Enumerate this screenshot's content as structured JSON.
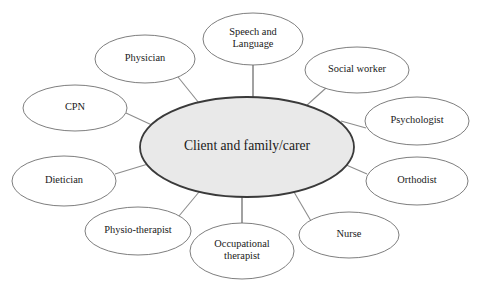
{
  "diagram": {
    "type": "hub-and-spoke",
    "center": {
      "id": "client-and-family-carer",
      "label": "Client and family/carer",
      "lines": [
        "Client and family/carer"
      ],
      "cx": 247,
      "cy": 147,
      "rx": 107,
      "ry": 50,
      "fill_color": "#e9e9e9",
      "stroke_color": "#3a3a3a"
    },
    "satellites": [
      {
        "id": "speech-and-language",
        "label": "Speech and Language",
        "lines": [
          "Speech and",
          "Language"
        ],
        "cx": 253,
        "cy": 39,
        "rx": 50,
        "ry": 26,
        "connector": {
          "x1": 253,
          "y1": 65,
          "x2": 253,
          "y2": 97,
          "weight": "thick"
        }
      },
      {
        "id": "physician",
        "label": "Physician",
        "lines": [
          "Physician"
        ],
        "cx": 145,
        "cy": 59,
        "rx": 50,
        "ry": 24,
        "connector": {
          "x1": 178,
          "y1": 77,
          "x2": 199,
          "y2": 103,
          "weight": "thin"
        }
      },
      {
        "id": "cpn",
        "label": "CPN",
        "lines": [
          "CPN"
        ],
        "cx": 75,
        "cy": 108,
        "rx": 52,
        "ry": 23,
        "connector": {
          "x1": 126,
          "y1": 113,
          "x2": 154,
          "y2": 126,
          "weight": "thin"
        }
      },
      {
        "id": "dietician",
        "label": "Dietician",
        "lines": [
          "Dietician"
        ],
        "cx": 64,
        "cy": 181,
        "rx": 52,
        "ry": 25,
        "connector": {
          "x1": 115,
          "y1": 174,
          "x2": 148,
          "y2": 164,
          "weight": "thin"
        }
      },
      {
        "id": "physio-therapist",
        "label": "Physio-therapist",
        "lines": [
          "Physio-therapist"
        ],
        "cx": 138,
        "cy": 231,
        "rx": 53,
        "ry": 24,
        "connector": {
          "x1": 179,
          "y1": 216,
          "x2": 199,
          "y2": 192,
          "weight": "thin"
        }
      },
      {
        "id": "occupational-therapist",
        "label": "Occupational therapist",
        "lines": [
          "Occupational",
          "therapist"
        ],
        "cx": 242,
        "cy": 251,
        "rx": 52,
        "ry": 28,
        "connector": {
          "x1": 242,
          "y1": 223,
          "x2": 242,
          "y2": 197,
          "weight": "thick"
        }
      },
      {
        "id": "nurse",
        "label": "Nurse",
        "lines": [
          "Nurse"
        ],
        "cx": 349,
        "cy": 235,
        "rx": 50,
        "ry": 23,
        "connector": {
          "x1": 311,
          "y1": 221,
          "x2": 294,
          "y2": 192,
          "weight": "thin"
        }
      },
      {
        "id": "orthodist",
        "label": "Orthodist",
        "lines": [
          "Orthodist"
        ],
        "cx": 417,
        "cy": 181,
        "rx": 51,
        "ry": 24,
        "connector": {
          "x1": 367,
          "y1": 174,
          "x2": 344,
          "y2": 164,
          "weight": "thin"
        }
      },
      {
        "id": "psychologist",
        "label": "Psychologist",
        "lines": [
          "Psychologist"
        ],
        "cx": 417,
        "cy": 121,
        "rx": 52,
        "ry": 24,
        "connector": {
          "x1": 366,
          "y1": 128,
          "x2": 341,
          "y2": 121,
          "weight": "thin"
        }
      },
      {
        "id": "social-worker",
        "label": "Social worker",
        "lines": [
          "Social worker"
        ],
        "cx": 357,
        "cy": 70,
        "rx": 52,
        "ry": 23,
        "connector": {
          "x1": 326,
          "y1": 88,
          "x2": 306,
          "y2": 106,
          "weight": "thin"
        }
      }
    ]
  }
}
